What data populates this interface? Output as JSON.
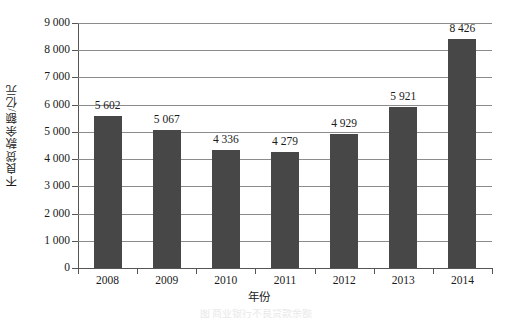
{
  "chart_data": {
    "type": "bar",
    "title": "",
    "xlabel": "年份",
    "ylabel": "不良贷款余额/亿元",
    "categories": [
      "2008",
      "2009",
      "2010",
      "2011",
      "2012",
      "2013",
      "2014"
    ],
    "values": [
      5602,
      5067,
      4336,
      4279,
      4929,
      5921,
      8426
    ],
    "value_labels": [
      "5 602",
      "5 067",
      "4 336",
      "4 279",
      "4 929",
      "5 921",
      "8 426"
    ],
    "ylim": [
      0,
      9000
    ],
    "ytick_labels": [
      "0",
      "1 000",
      "2 000",
      "3 000",
      "4 000",
      "5 000",
      "6 000",
      "7 000",
      "8 000",
      "9 000"
    ],
    "ytick_values": [
      0,
      1000,
      2000,
      3000,
      4000,
      5000,
      6000,
      7000,
      8000,
      9000
    ],
    "grid": true,
    "legend": "none",
    "series": [
      {
        "name": "不良贷款余额",
        "values": [
          5602,
          5067,
          4336,
          4279,
          4929,
          5921,
          8426
        ],
        "color": "#474747"
      }
    ],
    "bar_color": "#474747",
    "grid_color": "#8c8c8c",
    "axis_color": "#555555",
    "background": "#ffffff"
  },
  "figure": {
    "caption": "图  商业银行不良贷款余额"
  }
}
